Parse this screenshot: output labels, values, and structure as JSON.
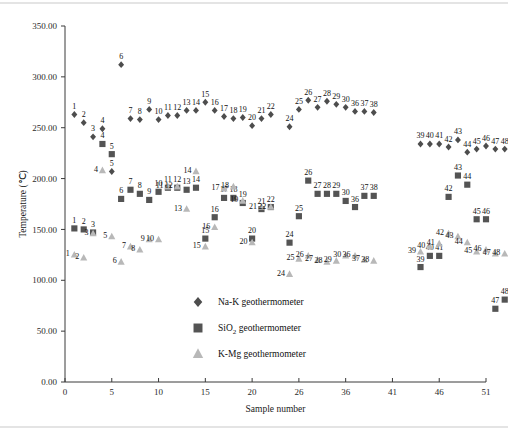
{
  "chart_data": {
    "type": "scatter",
    "title": "",
    "xlabel": "Sample number",
    "ylabel": "Temperature (℃)",
    "xlim": [
      0,
      51
    ],
    "ylim": [
      0,
      350
    ],
    "xticks": [
      "0",
      "5",
      "10",
      "15",
      "20",
      "26",
      "36",
      "41",
      "46",
      "51"
    ],
    "yticks": [
      "0.00",
      "50.00",
      "100.00",
      "150.00",
      "200.00",
      "250.00",
      "300.00",
      "350.00"
    ],
    "grid": false,
    "legend_position": "inside-center-bottom",
    "point_labels": true,
    "series": [
      {
        "name": "Na-K geothermometer",
        "marker": "diamond",
        "color": "#4d4d4d",
        "points": [
          {
            "label": "1",
            "x": 1,
            "y": 263
          },
          {
            "label": "2",
            "x": 2,
            "y": 255
          },
          {
            "label": "3",
            "x": 3,
            "y": 241
          },
          {
            "label": "4",
            "x": 4,
            "y": 249
          },
          {
            "label": "5",
            "x": 5,
            "y": 207
          },
          {
            "label": "6",
            "x": 6,
            "y": 312
          },
          {
            "label": "7",
            "x": 7,
            "y": 259
          },
          {
            "label": "8",
            "x": 8,
            "y": 258
          },
          {
            "label": "9",
            "x": 9,
            "y": 268
          },
          {
            "label": "10",
            "x": 10,
            "y": 258
          },
          {
            "label": "11",
            "x": 11,
            "y": 262
          },
          {
            "label": "12",
            "x": 12,
            "y": 262
          },
          {
            "label": "13",
            "x": 13,
            "y": 267
          },
          {
            "label": "14",
            "x": 14,
            "y": 267
          },
          {
            "label": "15",
            "x": 15,
            "y": 275
          },
          {
            "label": "16",
            "x": 16,
            "y": 267
          },
          {
            "label": "17",
            "x": 17,
            "y": 261
          },
          {
            "label": "18",
            "x": 18,
            "y": 259
          },
          {
            "label": "19",
            "x": 19,
            "y": 260
          },
          {
            "label": "20",
            "x": 20,
            "y": 252
          },
          {
            "label": "21",
            "x": 21,
            "y": 259
          },
          {
            "label": "22",
            "x": 22,
            "y": 263
          },
          {
            "label": "24",
            "x": 24,
            "y": 251
          },
          {
            "label": "25",
            "x": 25,
            "y": 268
          },
          {
            "label": "26",
            "x": 26,
            "y": 277
          },
          {
            "label": "27",
            "x": 27,
            "y": 270
          },
          {
            "label": "28",
            "x": 28,
            "y": 276
          },
          {
            "label": "29",
            "x": 29,
            "y": 273
          },
          {
            "label": "30",
            "x": 30,
            "y": 270
          },
          {
            "label": "36",
            "x": 31,
            "y": 266
          },
          {
            "label": "37",
            "x": 32,
            "y": 266
          },
          {
            "label": "38",
            "x": 33,
            "y": 265
          },
          {
            "label": "39",
            "x": 38,
            "y": 234
          },
          {
            "label": "40",
            "x": 39,
            "y": 234
          },
          {
            "label": "41",
            "x": 40,
            "y": 234
          },
          {
            "label": "42",
            "x": 41,
            "y": 231
          },
          {
            "label": "43",
            "x": 42,
            "y": 238
          },
          {
            "label": "44",
            "x": 43,
            "y": 226
          },
          {
            "label": "45",
            "x": 44,
            "y": 229
          },
          {
            "label": "46",
            "x": 45,
            "y": 232
          },
          {
            "label": "47",
            "x": 46,
            "y": 229
          },
          {
            "label": "48",
            "x": 47,
            "y": 229
          }
        ]
      },
      {
        "name": "SiO2 geothermometer",
        "marker": "square",
        "color": "#545454",
        "points": [
          {
            "label": "1",
            "x": 1,
            "y": 151
          },
          {
            "label": "2",
            "x": 2,
            "y": 150
          },
          {
            "label": "3",
            "x": 3,
            "y": 147
          },
          {
            "label": "4",
            "x": 4,
            "y": 234
          },
          {
            "label": "5",
            "x": 5,
            "y": 224
          },
          {
            "label": "6",
            "x": 6,
            "y": 180
          },
          {
            "label": "7",
            "x": 7,
            "y": 189
          },
          {
            "label": "8",
            "x": 8,
            "y": 185
          },
          {
            "label": "9",
            "x": 9,
            "y": 179
          },
          {
            "label": "10",
            "x": 10,
            "y": 187
          },
          {
            "label": "11",
            "x": 11,
            "y": 191
          },
          {
            "label": "12",
            "x": 12,
            "y": 191
          },
          {
            "label": "13",
            "x": 13,
            "y": 189
          },
          {
            "label": "14",
            "x": 14,
            "y": 191
          },
          {
            "label": "15",
            "x": 15,
            "y": 141
          },
          {
            "label": "16",
            "x": 16,
            "y": 162
          },
          {
            "label": "17",
            "x": 17,
            "y": 181
          },
          {
            "label": "18",
            "x": 18,
            "y": 181
          },
          {
            "label": "19",
            "x": 19,
            "y": 176
          },
          {
            "label": "20",
            "x": 20,
            "y": 141
          },
          {
            "label": "21",
            "x": 21,
            "y": 170
          },
          {
            "label": "22",
            "x": 22,
            "y": 172
          },
          {
            "label": "24",
            "x": 24,
            "y": 137
          },
          {
            "label": "25",
            "x": 25,
            "y": 163
          },
          {
            "label": "26",
            "x": 26,
            "y": 198
          },
          {
            "label": "27",
            "x": 27,
            "y": 185
          },
          {
            "label": "28",
            "x": 28,
            "y": 185
          },
          {
            "label": "29",
            "x": 29,
            "y": 185
          },
          {
            "label": "30",
            "x": 30,
            "y": 178
          },
          {
            "label": "36",
            "x": 31,
            "y": 172
          },
          {
            "label": "37",
            "x": 32,
            "y": 183
          },
          {
            "label": "38",
            "x": 33,
            "y": 183
          },
          {
            "label": "39",
            "x": 38,
            "y": 113
          },
          {
            "label": "40",
            "x": 39,
            "y": 124
          },
          {
            "label": "41",
            "x": 40,
            "y": 124
          },
          {
            "label": "42",
            "x": 41,
            "y": 182
          },
          {
            "label": "43",
            "x": 42,
            "y": 203
          },
          {
            "label": "44",
            "x": 43,
            "y": 194
          },
          {
            "label": "45",
            "x": 44,
            "y": 160
          },
          {
            "label": "46",
            "x": 45,
            "y": 160
          },
          {
            "label": "47",
            "x": 46,
            "y": 72
          },
          {
            "label": "48",
            "x": 47,
            "y": 81
          }
        ]
      },
      {
        "name": "K-Mg geothermometer",
        "marker": "triangle",
        "color": "#b8b8b8",
        "points": [
          {
            "label": "1",
            "x": 1,
            "y": 125
          },
          {
            "label": "2",
            "x": 2,
            "y": 122
          },
          {
            "label": "3",
            "x": 3,
            "y": 146
          },
          {
            "label": "4",
            "x": 4,
            "y": 208
          },
          {
            "label": "5",
            "x": 5,
            "y": 143
          },
          {
            "label": "6",
            "x": 6,
            "y": 118
          },
          {
            "label": "7",
            "x": 7,
            "y": 133
          },
          {
            "label": "8",
            "x": 8,
            "y": 130
          },
          {
            "label": "9",
            "x": 9,
            "y": 140
          },
          {
            "label": "10",
            "x": 10,
            "y": 140
          },
          {
            "label": "11",
            "x": 11,
            "y": 192
          },
          {
            "label": "12",
            "x": 12,
            "y": 192
          },
          {
            "label": "13",
            "x": 13,
            "y": 170
          },
          {
            "label": "14",
            "x": 14,
            "y": 207
          },
          {
            "label": "15",
            "x": 15,
            "y": 133
          },
          {
            "label": "16",
            "x": 16,
            "y": 152
          },
          {
            "label": "17",
            "x": 17,
            "y": 190
          },
          {
            "label": "18",
            "x": 18,
            "y": 192
          },
          {
            "label": "19",
            "x": 19,
            "y": 178
          },
          {
            "label": "20",
            "x": 20,
            "y": 137
          },
          {
            "label": "21",
            "x": 21,
            "y": 172
          },
          {
            "label": "22",
            "x": 22,
            "y": 172
          },
          {
            "label": "24",
            "x": 24,
            "y": 106
          },
          {
            "label": "25",
            "x": 25,
            "y": 121
          },
          {
            "label": "26",
            "x": 26,
            "y": 124
          },
          {
            "label": "27",
            "x": 27,
            "y": 120
          },
          {
            "label": "28",
            "x": 28,
            "y": 118
          },
          {
            "label": "29",
            "x": 29,
            "y": 119
          },
          {
            "label": "30",
            "x": 30,
            "y": 124
          },
          {
            "label": "36",
            "x": 31,
            "y": 124
          },
          {
            "label": "37",
            "x": 32,
            "y": 120
          },
          {
            "label": "38",
            "x": 33,
            "y": 119
          },
          {
            "label": "39",
            "x": 38,
            "y": 128
          },
          {
            "label": "40",
            "x": 39,
            "y": 133
          },
          {
            "label": "41",
            "x": 40,
            "y": 136
          },
          {
            "label": "42",
            "x": 41,
            "y": 146
          },
          {
            "label": "43",
            "x": 42,
            "y": 143
          },
          {
            "label": "44",
            "x": 43,
            "y": 137
          },
          {
            "label": "45",
            "x": 44,
            "y": 128
          },
          {
            "label": "46",
            "x": 45,
            "y": 130
          },
          {
            "label": "47",
            "x": 46,
            "y": 126
          },
          {
            "label": "48",
            "x": 47,
            "y": 126
          }
        ]
      }
    ]
  },
  "legend": {
    "items": [
      {
        "label": "Na-K geothermometer",
        "marker": "diamond",
        "color": "#4d4d4d"
      },
      {
        "label": "SiO2 geothermometer",
        "label_html": "SiO₂ geothermometer",
        "marker": "square",
        "color": "#545454"
      },
      {
        "label": "K-Mg geothermometer",
        "marker": "triangle",
        "color": "#b8b8b8"
      }
    ]
  }
}
